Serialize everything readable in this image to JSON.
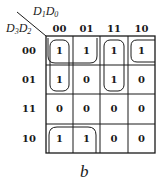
{
  "kmap": {
    "corner": {
      "col_vars": {
        "a": "D",
        "a_sub": "1",
        "b": "D",
        "b_sub": "0"
      },
      "row_vars": {
        "a": "D",
        "a_sub": "3",
        "b": "D",
        "b_sub": "2"
      }
    },
    "col_labels": [
      "00",
      "01",
      "11",
      "10"
    ],
    "row_labels": [
      "00",
      "01",
      "11",
      "10"
    ],
    "cells": [
      [
        "1",
        "1",
        "1",
        "1"
      ],
      [
        "1",
        "0",
        "1",
        "0"
      ],
      [
        "0",
        "0",
        "0",
        "0"
      ],
      [
        "1",
        "1",
        "0",
        "0"
      ]
    ],
    "groups": [
      {
        "name": "row00-col00-01-plus-row10-wrap",
        "description": "Loop around row 00 cols 00,01 wrapping to row 10 cols 00,01"
      },
      {
        "name": "col00-rows00-01",
        "description": "Vertical loop col 00 rows 00-01"
      },
      {
        "name": "col11-rows00-01",
        "description": "Vertical loop col 11 rows 00-01"
      },
      {
        "name": "row00-col10-wrap-col00",
        "description": "Loop col 10 row 00 wrapping with col 00"
      }
    ]
  },
  "caption": "b"
}
